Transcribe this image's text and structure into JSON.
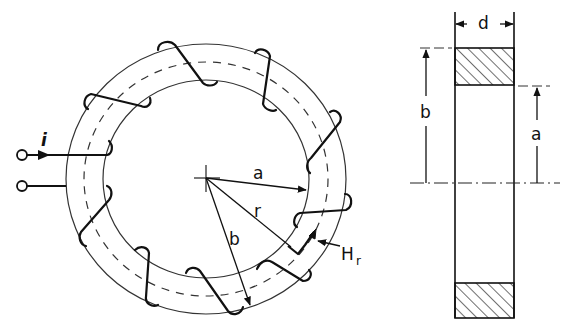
{
  "figure": {
    "type": "toroid-with-windings",
    "front_view": {
      "labels": {
        "current": "i",
        "inner_radius": "a",
        "mean_radius": "r",
        "outer_radius": "b",
        "field": "H",
        "field_subscript": "r"
      },
      "turns": 10,
      "terminals": 2
    },
    "cross_section": {
      "labels": {
        "thickness": "d",
        "outer_radius": "b",
        "inner_radius": "a"
      }
    }
  },
  "colors": {
    "line": "#111111",
    "thin_line": "#333333",
    "background": "#ffffff"
  }
}
